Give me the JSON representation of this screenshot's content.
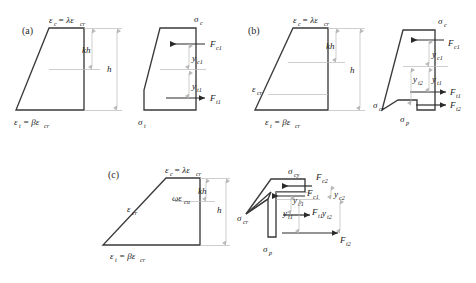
{
  "figure": {
    "background_color": "#ffffff",
    "line_color": "#3a3a3a",
    "dimension_color": "#b9b9b9",
    "arrow_color": "#2a2a2a",
    "text_color": "#1a1a1a"
  },
  "panels": [
    {
      "id": "a",
      "label": "(a)",
      "strain_diagram": {
        "top_label": {
          "main": "ε",
          "main_sub": "c",
          "eq": "= λε",
          "eq_sub": "cr"
        },
        "bottom_label": {
          "main": "ε",
          "main_sub": "t",
          "eq": "= βε",
          "eq_sub": "cr"
        },
        "dim_kh": {
          "text": "kh"
        },
        "dim_h": {
          "text": "h"
        }
      },
      "stress_diagram": {
        "top_stress": {
          "main": "σ",
          "main_sub": "c"
        },
        "bottom_stress": {
          "main": "σ",
          "main_sub": "t"
        },
        "forces": [
          {
            "main": "F",
            "sub": "c1",
            "direction": "left"
          },
          {
            "main": "F",
            "sub": "t1",
            "direction": "right"
          }
        ],
        "lever_arms": [
          {
            "main": "y",
            "sub": "c1"
          },
          {
            "main": "y",
            "sub": "t1"
          }
        ]
      }
    },
    {
      "id": "b",
      "label": "(b)",
      "strain_diagram": {
        "top_label": {
          "main": "ε",
          "main_sub": "c",
          "eq": "= λε",
          "eq_sub": "cr"
        },
        "bottom_label": {
          "main": "ε",
          "main_sub": "t",
          "eq": "= βε",
          "eq_sub": "cr"
        },
        "mid_label": {
          "main": "ε",
          "main_sub": "cr"
        },
        "dim_kh": {
          "text": "kh"
        },
        "dim_h": {
          "text": "h"
        }
      },
      "stress_diagram": {
        "top_stress": {
          "main": "σ",
          "main_sub": "c"
        },
        "cr_stress": {
          "main": "σ",
          "main_sub": "cr"
        },
        "p_stress": {
          "main": "σ",
          "main_sub": "p"
        },
        "forces": [
          {
            "main": "F",
            "sub": "c1",
            "direction": "left"
          },
          {
            "main": "F",
            "sub": "t1",
            "direction": "right"
          },
          {
            "main": "F",
            "sub": "t2",
            "direction": "right"
          }
        ],
        "lever_arms": [
          {
            "main": "y",
            "sub": "c1"
          },
          {
            "main": "y",
            "sub": "t1"
          },
          {
            "main": "y",
            "sub": "t2"
          }
        ]
      }
    },
    {
      "id": "c",
      "label": "(c)",
      "strain_diagram": {
        "top_label": {
          "main": "ε",
          "main_sub": "c",
          "eq": "= λε",
          "eq_sub": "cr"
        },
        "bottom_label": {
          "main": "ε",
          "main_sub": "t",
          "eq": "= βε",
          "eq_sub": "cr"
        },
        "mid_label": {
          "main": "ε",
          "main_sub": "cr"
        },
        "omega_label": {
          "main": "ωε",
          "main_sub": "cu"
        },
        "dim_kh": {
          "text": "kh"
        },
        "dim_h": {
          "text": "h"
        }
      },
      "stress_diagram": {
        "top_stress": {
          "main": "σ",
          "main_sub": "cy"
        },
        "cr_stress": {
          "main": "σ",
          "main_sub": "cr"
        },
        "p_stress": {
          "main": "σ",
          "main_sub": "p"
        },
        "forces": [
          {
            "main": "F",
            "sub": "c2",
            "direction": "left"
          },
          {
            "main": "F",
            "sub": "c1",
            "direction": "left"
          },
          {
            "main": "F",
            "sub": "t1",
            "direction": "right"
          },
          {
            "main": "F",
            "sub": "t2",
            "direction": "right"
          }
        ],
        "lever_arms": [
          {
            "main": "y",
            "sub": "c2"
          },
          {
            "main": "y",
            "sub": "c1"
          },
          {
            "main": "y",
            "sub": "t1"
          },
          {
            "main": "y",
            "sub": "t2"
          }
        ]
      }
    }
  ]
}
